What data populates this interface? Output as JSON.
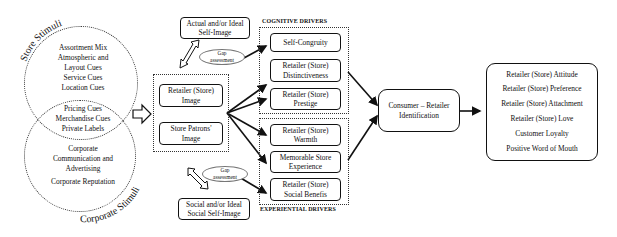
{
  "store_stimuli": {
    "title": "Store Stimuli",
    "items": [
      "Assortment Mix",
      "Atmospheric and",
      "Layout Cues",
      "Service Cues",
      "Location Cues"
    ]
  },
  "shared_stimuli": {
    "items": [
      "Pricing Cues",
      "Merchandise Cues",
      "Private Labels"
    ]
  },
  "corporate_stimuli": {
    "title": "Corporate Stimuli",
    "items": [
      "Corporate",
      "Communication and",
      "Advertising"
    ],
    "reputation": "Corporate Reputation"
  },
  "self_image": {
    "actual": [
      "Actual and/or Ideal",
      "Self-Image"
    ],
    "social": [
      "Social and/or Ideal",
      "Social Self-Image"
    ],
    "gap_top": [
      "Gap",
      "assessment"
    ],
    "gap_bottom": [
      "Gap",
      "assessment"
    ]
  },
  "images": {
    "retailer": [
      "Retailer (Store)",
      "Image"
    ],
    "patrons": [
      "Store Patrons'",
      "Image"
    ]
  },
  "cognitive_drivers": {
    "header": "COGNITIVE DRIVERS",
    "items": [
      [
        "Self-Congruity",
        ""
      ],
      [
        "Retailer (Store)",
        "Distinctiveness"
      ],
      [
        "Retailer (Store)",
        "Prestige"
      ]
    ]
  },
  "experiential_drivers": {
    "header": "EXPERIENTIAL DRIVERS",
    "items": [
      [
        "Retailer (Store)",
        "Warmth"
      ],
      [
        "Memorable Store",
        "Experience"
      ],
      [
        "Retailer (Store)",
        "Social Benefis"
      ]
    ]
  },
  "identification": [
    "Consumer – Retailer",
    "Identification"
  ],
  "outcomes": [
    "Retailer (Store) Attitude",
    "Retailer (Store) Preference",
    "Retailer (Store) Attachment",
    "Retailer (Store) Love",
    "Customer Loyalty",
    "Positive Word of Mouth"
  ]
}
